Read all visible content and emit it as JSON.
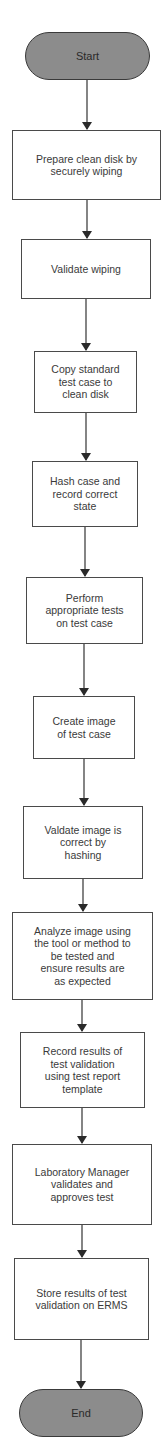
{
  "diagram": {
    "type": "flowchart",
    "direction": "top-to-bottom",
    "colors": {
      "terminal_fill": "#8c8c8c",
      "terminal_border": "#3a3a3a",
      "process_fill": "#ffffff",
      "process_border": "#4a4a4a",
      "edge": "#333333",
      "text": "#3a3a3a"
    },
    "nodes": [
      {
        "id": "start",
        "shape": "terminal",
        "label": "Start"
      },
      {
        "id": "step1",
        "shape": "process",
        "label": "Prepare clean disk by\nsecurely wiping"
      },
      {
        "id": "step2",
        "shape": "process",
        "label": "Validate wiping"
      },
      {
        "id": "step3",
        "shape": "process",
        "label": "Copy standard\ntest case to\nclean disk"
      },
      {
        "id": "step4",
        "shape": "process",
        "label": "Hash case and\nrecord correct\nstate"
      },
      {
        "id": "step5",
        "shape": "process",
        "label": "Perform\nappropriate tests\non test case"
      },
      {
        "id": "step6",
        "shape": "process",
        "label": "Create image\nof test case"
      },
      {
        "id": "step7",
        "shape": "process",
        "label": "Valdate image is\ncorrect by\nhashing"
      },
      {
        "id": "step8",
        "shape": "process",
        "label": "Analyze image using\nthe tool or method to\nbe tested and\nensure results are\nas expected"
      },
      {
        "id": "step9",
        "shape": "process",
        "label": "Record results of\ntest validation\nusing test report\ntemplate"
      },
      {
        "id": "step10",
        "shape": "process",
        "label": "Laboratory Manager\nvalidates and\napproves test"
      },
      {
        "id": "step11",
        "shape": "process",
        "label": "Store results of test\nvalidation on ERMS"
      },
      {
        "id": "end",
        "shape": "terminal",
        "label": "End"
      }
    ],
    "edges": [
      {
        "from": "start",
        "to": "step1"
      },
      {
        "from": "step1",
        "to": "step2"
      },
      {
        "from": "step2",
        "to": "step3"
      },
      {
        "from": "step3",
        "to": "step4"
      },
      {
        "from": "step4",
        "to": "step5"
      },
      {
        "from": "step5",
        "to": "step6"
      },
      {
        "from": "step6",
        "to": "step7"
      },
      {
        "from": "step7",
        "to": "step8"
      },
      {
        "from": "step8",
        "to": "step9"
      },
      {
        "from": "step9",
        "to": "step10"
      },
      {
        "from": "step10",
        "to": "step11"
      },
      {
        "from": "step11",
        "to": "end"
      }
    ]
  }
}
